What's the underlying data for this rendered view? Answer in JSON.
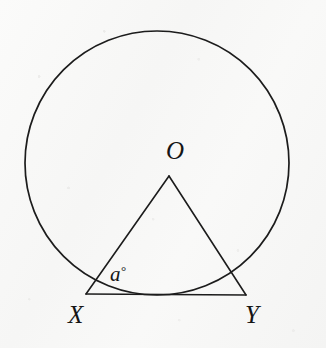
{
  "figure": {
    "background_color": "#f8f8f7",
    "ink_color": "#1c1c1c",
    "labels": {
      "center": "O",
      "left_point": "X",
      "right_point": "Y",
      "angle": "a",
      "degree_symbol": "°"
    },
    "geometry": {
      "circle": {
        "cx": 157,
        "cy": 163,
        "r": 132
      },
      "center_point": {
        "x": 169,
        "y": 176
      },
      "point_x": {
        "x": 86,
        "y": 294
      },
      "point_y": {
        "x": 246,
        "y": 295
      },
      "stroke_width": 1.6
    }
  }
}
